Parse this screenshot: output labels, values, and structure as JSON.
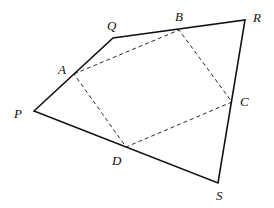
{
  "diagram": {
    "type": "geometry",
    "quadrilateral": [
      "P",
      "Q",
      "R",
      "S"
    ],
    "inner_quadrilateral": [
      "A",
      "B",
      "C",
      "D"
    ],
    "points": {
      "P": {
        "label": "P",
        "x": 34,
        "y": 111,
        "lx": 14,
        "ly": 118
      },
      "Q": {
        "label": "Q",
        "x": 113,
        "y": 38,
        "lx": 107,
        "ly": 30
      },
      "R": {
        "label": "R",
        "x": 245,
        "y": 20,
        "lx": 253,
        "ly": 22
      },
      "S": {
        "label": "S",
        "x": 218,
        "y": 183,
        "lx": 216,
        "ly": 200
      },
      "A": {
        "label": "A",
        "x": 74,
        "y": 74,
        "lx": 58,
        "ly": 74
      },
      "B": {
        "label": "B",
        "x": 179,
        "y": 30,
        "lx": 175,
        "ly": 21
      },
      "C": {
        "label": "C",
        "x": 232,
        "y": 102,
        "lx": 240,
        "ly": 106
      },
      "D": {
        "label": "D",
        "x": 126,
        "y": 147,
        "lx": 112,
        "ly": 165
      }
    },
    "colors": {
      "line": "#111111",
      "background": "#ffffff"
    }
  }
}
